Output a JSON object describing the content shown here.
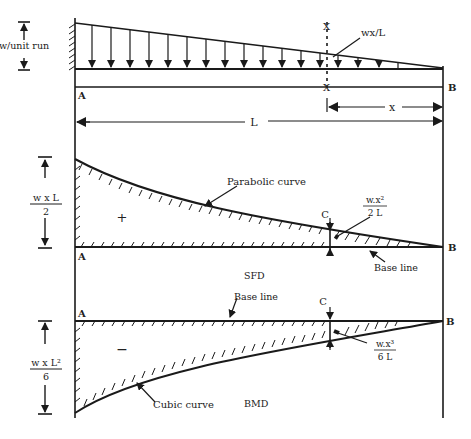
{
  "diagram": {
    "colors": {
      "ink": "#1a1a1a",
      "background": "#ffffff"
    },
    "loading": {
      "intensity_label": "w/unit run",
      "section_load_label": "wx/L",
      "section_mark": "X",
      "support_left": "A",
      "support_right": "B",
      "span_label": "L",
      "distance_label": "x"
    },
    "sfd": {
      "name": "SFD",
      "max_label_num": "w x L",
      "max_label_den": "2",
      "curve_label": "Parabolic curve",
      "sign": "+",
      "section_label": "C",
      "section_value_num": "w.x²",
      "section_value_den": "2 L",
      "baseline_label": "Base line",
      "left_end": "A",
      "right_end": "B"
    },
    "bmd": {
      "name": "BMD",
      "max_label_num": "w x L²",
      "max_label_den": "6",
      "curve_label": "Cubic curve",
      "sign": "−",
      "section_label": "C",
      "section_value_num": "w.x³",
      "section_value_den": "6 L",
      "baseline_label": "Base line",
      "left_end": "A",
      "right_end": "B"
    }
  }
}
